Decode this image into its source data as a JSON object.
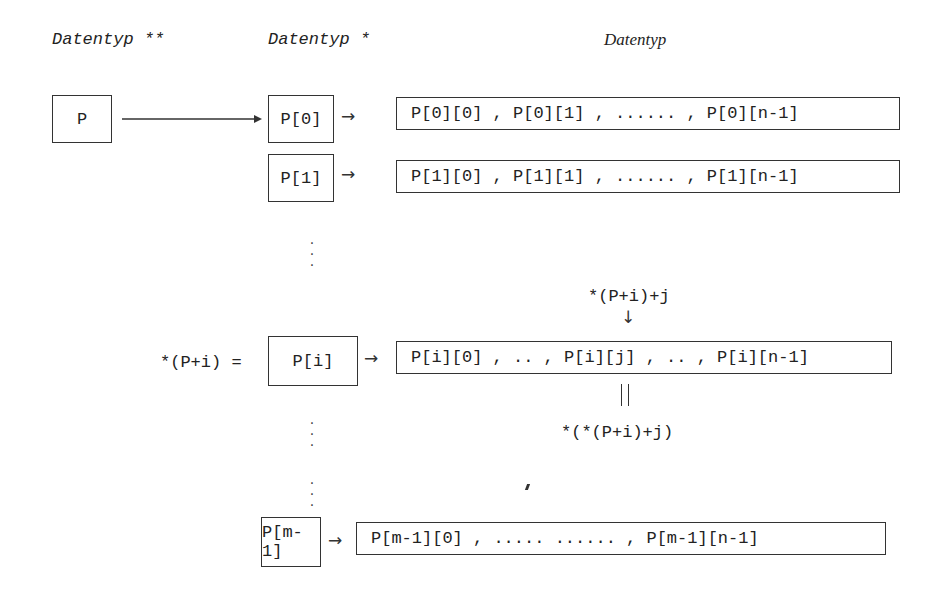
{
  "headers": {
    "col1": "Datentyp **",
    "col2": "Datentyp *",
    "col3": "Datentyp"
  },
  "pointer_box": "P",
  "rows": [
    {
      "pointer": "P[0]",
      "values": "P[0][0] , P[0][1] , ...... , P[0][n-1]"
    },
    {
      "pointer": "P[1]",
      "values": "P[1][0] , P[1][1] , ...... , P[1][n-1]"
    },
    {
      "pointer": "P[i]",
      "values": "P[i][0] , .. , P[i][j] , .. , P[i][n-1]"
    },
    {
      "pointer": "P[m-1]",
      "values": "P[m-1][0] , ..... ...... , P[m-1][n-1]"
    }
  ],
  "annotations": {
    "row_i_prefix": "*(P+i) =",
    "element_address": "*(P+i)+j",
    "down_arrow": "↓",
    "equals_sign": "||",
    "element_value": "*(*(P+i)+j)"
  },
  "glyphs": {
    "right_arrow": "→",
    "vertical_ellipsis": "⋮"
  }
}
